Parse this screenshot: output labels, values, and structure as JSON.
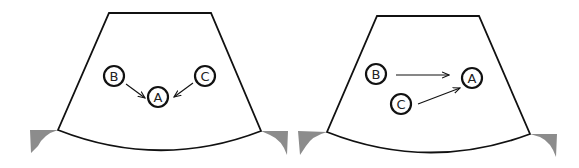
{
  "panels": [
    {
      "id": "left",
      "nodes": [
        {
          "label": "B",
          "x": 114,
          "y": 76
        },
        {
          "label": "A",
          "x": 158,
          "y": 97
        },
        {
          "label": "C",
          "x": 205,
          "y": 76
        }
      ],
      "arrows": [
        {
          "from": "B",
          "to": "A",
          "x1": 126,
          "y1": 84,
          "x2": 145,
          "y2": 98
        },
        {
          "from": "C",
          "to": "A",
          "x1": 193,
          "y1": 83,
          "x2": 174,
          "y2": 97
        }
      ]
    },
    {
      "id": "right",
      "nodes": [
        {
          "label": "B",
          "x": 376,
          "y": 74
        },
        {
          "label": "A",
          "x": 472,
          "y": 78
        },
        {
          "label": "C",
          "x": 401,
          "y": 104
        }
      ],
      "arrows": [
        {
          "from": "B",
          "to": "A",
          "x1": 396,
          "y1": 75,
          "x2": 449,
          "y2": 75
        },
        {
          "from": "C",
          "to": "A",
          "x1": 418,
          "y1": 104,
          "x2": 460,
          "y2": 88
        }
      ]
    }
  ],
  "colors": {
    "outline": "#111111",
    "wedge": "#8c8c8c",
    "background": "#ffffff"
  }
}
